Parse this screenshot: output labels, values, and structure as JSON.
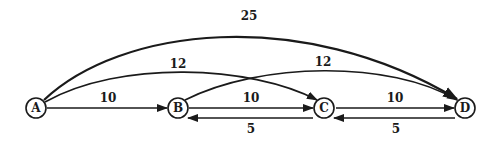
{
  "diagram": {
    "type": "directed-weighted-graph",
    "nodes": [
      {
        "id": "A",
        "label": "A"
      },
      {
        "id": "B",
        "label": "B"
      },
      {
        "id": "C",
        "label": "C"
      },
      {
        "id": "D",
        "label": "D"
      }
    ],
    "edges": [
      {
        "from": "A",
        "to": "B",
        "weight": "10"
      },
      {
        "from": "B",
        "to": "C",
        "weight": "10"
      },
      {
        "from": "C",
        "to": "D",
        "weight": "10"
      },
      {
        "from": "C",
        "to": "B",
        "weight": "5"
      },
      {
        "from": "D",
        "to": "C",
        "weight": "5"
      },
      {
        "from": "A",
        "to": "C",
        "weight": "12"
      },
      {
        "from": "B",
        "to": "D",
        "weight": "12"
      },
      {
        "from": "A",
        "to": "D",
        "weight": "25"
      }
    ],
    "colors": {
      "stroke": "#1a1a1a",
      "background": "#ffffff"
    }
  }
}
